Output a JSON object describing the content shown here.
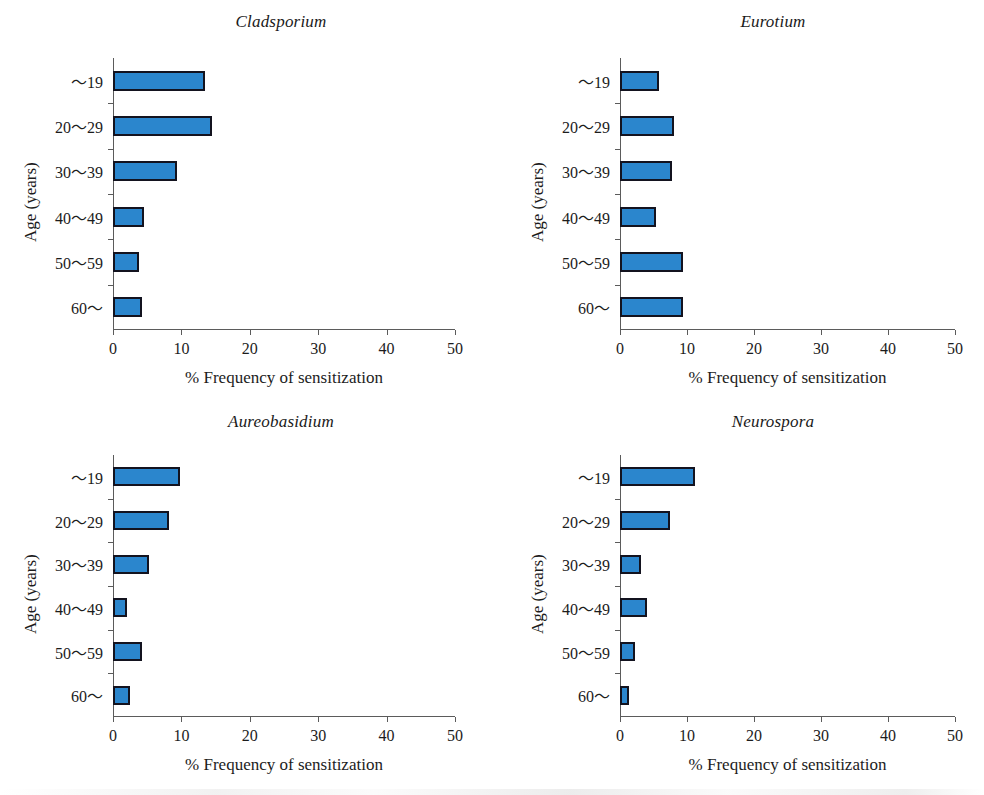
{
  "figure": {
    "width": 984,
    "height": 795,
    "background": "#ffffff",
    "bar_fill": "#2b86cd",
    "bar_edge": "#13131f",
    "axis_color": "#5b5b5b"
  },
  "common": {
    "xlabel": "% Frequency of sensitization",
    "ylabel": "Age (years)",
    "categories": [
      "〜19",
      "20〜29",
      "30〜39",
      "40〜49",
      "50〜59",
      "60〜"
    ],
    "xticks": [
      "0",
      "10",
      "20",
      "30",
      "40",
      "50"
    ],
    "xlim": [
      0,
      50
    ]
  },
  "chart_data": [
    {
      "type": "bar",
      "orientation": "horizontal",
      "title": "Cladsporium",
      "xlabel": "% Frequency of sensitization",
      "ylabel": "Age (years)",
      "categories": [
        "〜19",
        "20〜29",
        "30〜39",
        "40〜49",
        "50〜59",
        "60〜"
      ],
      "values": [
        13.5,
        14.5,
        9.3,
        4.6,
        3.8,
        4.3
      ],
      "xlim": [
        0,
        50
      ],
      "xticks": [
        0,
        10,
        20,
        30,
        40,
        50
      ],
      "grid": false,
      "legend": "none"
    },
    {
      "type": "bar",
      "orientation": "horizontal",
      "title": "Eurotium",
      "xlabel": "% Frequency of sensitization",
      "ylabel": "Age (years)",
      "categories": [
        "〜19",
        "20〜29",
        "30〜39",
        "40〜49",
        "50〜59",
        "60〜"
      ],
      "values": [
        5.8,
        8.0,
        7.8,
        5.3,
        9.4,
        9.4
      ],
      "xlim": [
        0,
        50
      ],
      "xticks": [
        0,
        10,
        20,
        30,
        40,
        50
      ],
      "grid": false,
      "legend": "none"
    },
    {
      "type": "bar",
      "orientation": "horizontal",
      "title": "Aureobasidium",
      "xlabel": "% Frequency of sensitization",
      "ylabel": "Age (years)",
      "categories": [
        "〜19",
        "20〜29",
        "30〜39",
        "40〜49",
        "50〜59",
        "60〜"
      ],
      "values": [
        9.8,
        8.2,
        5.2,
        2.1,
        4.2,
        2.5
      ],
      "xlim": [
        0,
        50
      ],
      "xticks": [
        0,
        10,
        20,
        30,
        40,
        50
      ],
      "grid": false,
      "legend": "none"
    },
    {
      "type": "bar",
      "orientation": "horizontal",
      "title": "Neurospora",
      "xlabel": "% Frequency of sensitization",
      "ylabel": "Age (years)",
      "categories": [
        "〜19",
        "20〜29",
        "30〜39",
        "40〜49",
        "50〜59",
        "60〜"
      ],
      "values": [
        11.2,
        7.4,
        3.2,
        4.0,
        2.3,
        1.3
      ],
      "xlim": [
        0,
        50
      ],
      "xticks": [
        0,
        10,
        20,
        30,
        40,
        50
      ],
      "grid": false,
      "legend": "none"
    }
  ],
  "panels": [
    {
      "title": "Cladsporium",
      "plot": {
        "left": 113,
        "top": 58,
        "width": 342,
        "height": 272
      }
    },
    {
      "title": "Eurotium",
      "plot": {
        "left": 620,
        "top": 58,
        "width": 335,
        "height": 272
      }
    },
    {
      "title": "Aureobasidium",
      "plot": {
        "left": 113,
        "top": 455,
        "width": 342,
        "height": 262
      }
    },
    {
      "title": "Neurospora",
      "plot": {
        "left": 620,
        "top": 455,
        "width": 335,
        "height": 262
      }
    }
  ]
}
